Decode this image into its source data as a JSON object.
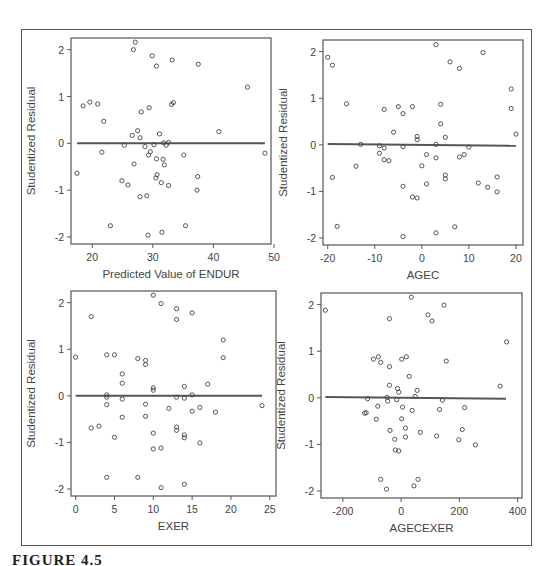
{
  "figure": {
    "caption": "FIGURE 4.5"
  },
  "chart_data": [
    {
      "type": "scatter",
      "title": "",
      "xlabel": "Predicted Value of ENDUR",
      "ylabel": "Studentized Residual",
      "xticks": [
        20,
        30,
        40,
        50
      ],
      "yticks": [
        -2,
        -1,
        0,
        1,
        2
      ],
      "xlim": [
        16.5,
        49.5
      ],
      "ylim": [
        -2.15,
        2.25
      ],
      "grid": false,
      "reference_line": {
        "x": [
          17.5,
          48.5
        ],
        "y": [
          0,
          0
        ]
      },
      "points": [
        [
          17.5,
          -0.64
        ],
        [
          18.5,
          0.8
        ],
        [
          19.6,
          0.88
        ],
        [
          20.9,
          0.84
        ],
        [
          21.6,
          -0.19
        ],
        [
          21.9,
          0.47
        ],
        [
          23.0,
          -1.76
        ],
        [
          24.9,
          -0.8
        ],
        [
          25.3,
          -0.04
        ],
        [
          25.9,
          -0.89
        ],
        [
          26.6,
          0.17
        ],
        [
          26.8,
          2.0
        ],
        [
          26.9,
          -0.44
        ],
        [
          27.1,
          2.16
        ],
        [
          27.5,
          0.27
        ],
        [
          27.9,
          -1.14
        ],
        [
          27.9,
          0.12
        ],
        [
          28.1,
          0.67
        ],
        [
          28.7,
          -0.07
        ],
        [
          29.0,
          -1.12
        ],
        [
          29.2,
          -1.96
        ],
        [
          29.3,
          -0.25
        ],
        [
          29.4,
          0.76
        ],
        [
          29.6,
          -0.18
        ],
        [
          29.9,
          1.87
        ],
        [
          30.2,
          -0.03
        ],
        [
          30.5,
          -0.74
        ],
        [
          30.6,
          1.65
        ],
        [
          30.6,
          -0.33
        ],
        [
          30.7,
          -0.67
        ],
        [
          31.1,
          0.2
        ],
        [
          31.4,
          -0.84
        ],
        [
          31.5,
          -1.9
        ],
        [
          31.7,
          -0.34
        ],
        [
          31.8,
          0.01
        ],
        [
          31.9,
          -0.46
        ],
        [
          32.2,
          -0.04
        ],
        [
          32.6,
          0.02
        ],
        [
          32.6,
          -0.9
        ],
        [
          33.1,
          0.83
        ],
        [
          33.2,
          1.78
        ],
        [
          33.4,
          0.87
        ],
        [
          35.1,
          -0.25
        ],
        [
          35.4,
          -1.76
        ],
        [
          37.3,
          -1.0
        ],
        [
          37.4,
          -0.71
        ],
        [
          37.5,
          1.69
        ],
        [
          40.9,
          0.25
        ],
        [
          45.6,
          1.2
        ],
        [
          48.5,
          -0.21
        ]
      ]
    },
    {
      "type": "scatter",
      "title": "",
      "xlabel": "AGEC",
      "ylabel": "Studentized Residual",
      "xticks": [
        -20,
        -10,
        0,
        10,
        20
      ],
      "yticks": [
        -2,
        -1,
        0,
        1,
        2
      ],
      "xlim": [
        -21,
        21.5
      ],
      "ylim": [
        -2.15,
        2.25
      ],
      "grid": false,
      "reference_line": {
        "x": [
          -20,
          20
        ],
        "y": [
          0.02,
          -0.02
        ]
      },
      "points": [
        [
          -20,
          1.88
        ],
        [
          -19,
          1.71
        ],
        [
          -19,
          -0.7
        ],
        [
          -18,
          -1.75
        ],
        [
          -16,
          0.88
        ],
        [
          -14,
          -0.46
        ],
        [
          -13,
          0.01
        ],
        [
          -9,
          -0.02
        ],
        [
          -9,
          -0.18
        ],
        [
          -8,
          0.76
        ],
        [
          -8,
          -0.07
        ],
        [
          -8,
          -0.32
        ],
        [
          -7,
          -0.34
        ],
        [
          -6,
          0.27
        ],
        [
          -5,
          0.82
        ],
        [
          -4,
          0.67
        ],
        [
          -4,
          -0.04
        ],
        [
          -4,
          -0.89
        ],
        [
          -4,
          -1.97
        ],
        [
          -2,
          0.82
        ],
        [
          -2,
          -1.12
        ],
        [
          -1,
          0.18
        ],
        [
          -1,
          0.11
        ],
        [
          -1,
          -1.14
        ],
        [
          0,
          -0.45
        ],
        [
          1,
          -0.21
        ],
        [
          1,
          -0.84
        ],
        [
          3,
          2.15
        ],
        [
          3,
          0.01
        ],
        [
          3,
          -0.28
        ],
        [
          3,
          -1.89
        ],
        [
          4,
          0.87
        ],
        [
          4,
          0.45
        ],
        [
          5,
          0.16
        ],
        [
          5,
          -0.65
        ],
        [
          5,
          -0.73
        ],
        [
          6,
          1.78
        ],
        [
          7,
          -1.76
        ],
        [
          8,
          1.64
        ],
        [
          8,
          -0.26
        ],
        [
          9,
          -0.21
        ],
        [
          10,
          -0.05
        ],
        [
          12,
          -0.82
        ],
        [
          13,
          1.98
        ],
        [
          14,
          -0.91
        ],
        [
          16,
          -0.69
        ],
        [
          16,
          -1.01
        ],
        [
          19,
          1.2
        ],
        [
          19,
          0.78
        ],
        [
          20,
          0.23
        ]
      ]
    },
    {
      "type": "scatter",
      "title": "",
      "xlabel": "EXER",
      "ylabel": "Studentized Residual",
      "xticks": [
        0,
        5,
        10,
        15,
        20,
        25
      ],
      "yticks": [
        -2,
        -1,
        0,
        1,
        2
      ],
      "xlim": [
        -0.6,
        25.8
      ],
      "ylim": [
        -2.15,
        2.25
      ],
      "grid": false,
      "reference_line": {
        "x": [
          0,
          24
        ],
        "y": [
          0,
          0
        ]
      },
      "points": [
        [
          0,
          0.83
        ],
        [
          2,
          1.7
        ],
        [
          2,
          -0.69
        ],
        [
          3,
          -0.65
        ],
        [
          4,
          0.88
        ],
        [
          4,
          0.02
        ],
        [
          4,
          -0.03
        ],
        [
          4,
          -0.19
        ],
        [
          4,
          -1.75
        ],
        [
          5,
          0.88
        ],
        [
          5,
          -0.89
        ],
        [
          6,
          0.47
        ],
        [
          6,
          0.27
        ],
        [
          6,
          -0.07
        ],
        [
          6,
          -0.46
        ],
        [
          8,
          0.8
        ],
        [
          8,
          -1.75
        ],
        [
          9,
          0.76
        ],
        [
          9,
          0.67
        ],
        [
          9,
          -0.18
        ],
        [
          9,
          -0.44
        ],
        [
          10,
          2.16
        ],
        [
          10,
          0.17
        ],
        [
          10,
          0.12
        ],
        [
          10,
          -0.8
        ],
        [
          10,
          -1.14
        ],
        [
          11,
          1.98
        ],
        [
          11,
          -1.12
        ],
        [
          11,
          -1.97
        ],
        [
          12,
          -0.27
        ],
        [
          13,
          1.87
        ],
        [
          13,
          1.64
        ],
        [
          13,
          -0.03
        ],
        [
          13,
          -0.67
        ],
        [
          13,
          -0.74
        ],
        [
          14,
          0.2
        ],
        [
          14,
          -0.05
        ],
        [
          14,
          -0.84
        ],
        [
          14,
          -0.9
        ],
        [
          14,
          -1.9
        ],
        [
          15,
          1.78
        ],
        [
          15,
          0.02
        ],
        [
          15,
          -0.33
        ],
        [
          16,
          -0.25
        ],
        [
          16,
          -1.01
        ],
        [
          17,
          0.25
        ],
        [
          18,
          -0.35
        ],
        [
          19,
          1.2
        ],
        [
          19,
          0.82
        ],
        [
          24,
          -0.21
        ]
      ]
    },
    {
      "type": "scatter",
      "title": "",
      "xlabel": "AGECEXER",
      "ylabel": "Studentized Residual",
      "xticks": [
        -200,
        0,
        200,
        400
      ],
      "yticks": [
        -2,
        -1,
        0,
        1,
        2
      ],
      "xlim": [
        -275,
        415
      ],
      "ylim": [
        -2.15,
        2.25
      ],
      "grid": false,
      "reference_line": {
        "x": [
          -260,
          360
        ],
        "y": [
          0.02,
          -0.02
        ]
      },
      "points": [
        [
          -260,
          1.88
        ],
        [
          -125,
          -0.33
        ],
        [
          -120,
          -0.32
        ],
        [
          -115,
          -0.02
        ],
        [
          -95,
          0.83
        ],
        [
          -85,
          -0.46
        ],
        [
          -80,
          -0.18
        ],
        [
          -78,
          0.88
        ],
        [
          -70,
          0.76
        ],
        [
          -70,
          -1.75
        ],
        [
          -40,
          1.7
        ],
        [
          -40,
          0.67
        ],
        [
          -40,
          0.27
        ],
        [
          -38,
          -0.7
        ],
        [
          -50,
          -1.96
        ],
        [
          -48,
          0.01
        ],
        [
          -46,
          -0.07
        ],
        [
          -22,
          -0.89
        ],
        [
          -20,
          -1.12
        ],
        [
          -15,
          -0.04
        ],
        [
          -12,
          0.2
        ],
        [
          -8,
          0.12
        ],
        [
          -8,
          -1.14
        ],
        [
          2,
          0.83
        ],
        [
          2,
          -0.45
        ],
        [
          5,
          -0.2
        ],
        [
          18,
          0.88
        ],
        [
          15,
          -0.65
        ],
        [
          15,
          -0.84
        ],
        [
          28,
          0.46
        ],
        [
          38,
          -0.27
        ],
        [
          35,
          2.16
        ],
        [
          44,
          -1.89
        ],
        [
          48,
          0.03
        ],
        [
          55,
          0.16
        ],
        [
          58,
          -1.75
        ],
        [
          66,
          -0.74
        ],
        [
          92,
          1.78
        ],
        [
          106,
          1.65
        ],
        [
          122,
          -0.82
        ],
        [
          132,
          -0.25
        ],
        [
          142,
          -0.05
        ],
        [
          147,
          1.99
        ],
        [
          155,
          0.79
        ],
        [
          198,
          -0.9
        ],
        [
          210,
          -0.68
        ],
        [
          218,
          -0.21
        ],
        [
          255,
          -1.01
        ],
        [
          340,
          0.25
        ],
        [
          362,
          1.2
        ]
      ]
    }
  ]
}
